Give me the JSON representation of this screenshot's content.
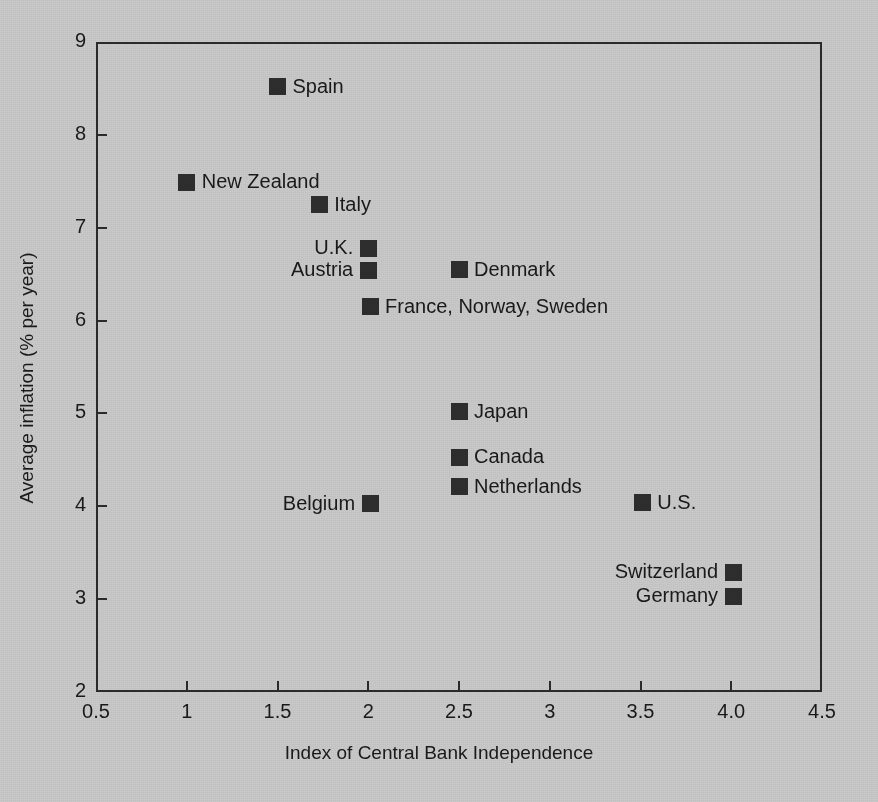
{
  "chart_data": {
    "type": "scatter",
    "title": "",
    "xlabel": "Index of Central Bank Independence",
    "ylabel": "Average inflation (% per year)",
    "xlim": [
      0.5,
      4.5
    ],
    "ylim": [
      2,
      9
    ],
    "grid": false,
    "legend": "none",
    "xticks": [
      "0.5",
      "1",
      "1.5",
      "2",
      "2.5",
      "3",
      "3.5",
      "4.0",
      "4.5"
    ],
    "xtick_values": [
      0.5,
      1,
      1.5,
      2,
      2.5,
      3,
      3.5,
      4.0,
      4.5
    ],
    "yticks": [
      "2",
      "3",
      "4",
      "5",
      "6",
      "7",
      "8",
      "9"
    ],
    "ytick_values": [
      2,
      3,
      4,
      5,
      6,
      7,
      8,
      9
    ],
    "marker_color": "#2e2e2e",
    "background_color": "#c9c9c9",
    "axis_color": "#2b2b2b",
    "points": [
      {
        "label": "Spain",
        "x": 1.5,
        "y": 8.52,
        "label_side": "right"
      },
      {
        "label": "New Zealand",
        "x": 1.0,
        "y": 7.49,
        "label_side": "right"
      },
      {
        "label": "Italy",
        "x": 1.73,
        "y": 7.25,
        "label_side": "right"
      },
      {
        "label": "U.K.",
        "x": 2.0,
        "y": 6.78,
        "label_side": "left"
      },
      {
        "label": "Austria",
        "x": 2.0,
        "y": 6.54,
        "label_side": "left"
      },
      {
        "label": "Denmark",
        "x": 2.5,
        "y": 6.55,
        "label_side": "right"
      },
      {
        "label": "France, Norway, Sweden",
        "x": 2.01,
        "y": 6.15,
        "label_side": "right"
      },
      {
        "label": "Japan",
        "x": 2.5,
        "y": 5.02,
        "label_side": "right"
      },
      {
        "label": "Canada",
        "x": 2.5,
        "y": 4.53,
        "label_side": "right"
      },
      {
        "label": "Netherlands",
        "x": 2.5,
        "y": 4.21,
        "label_side": "right"
      },
      {
        "label": "Belgium",
        "x": 2.01,
        "y": 4.03,
        "label_side": "left"
      },
      {
        "label": "U.S.",
        "x": 3.51,
        "y": 4.04,
        "label_side": "right"
      },
      {
        "label": "Switzerland",
        "x": 4.01,
        "y": 3.29,
        "label_side": "left"
      },
      {
        "label": "Germany",
        "x": 4.01,
        "y": 3.03,
        "label_side": "left"
      }
    ]
  }
}
